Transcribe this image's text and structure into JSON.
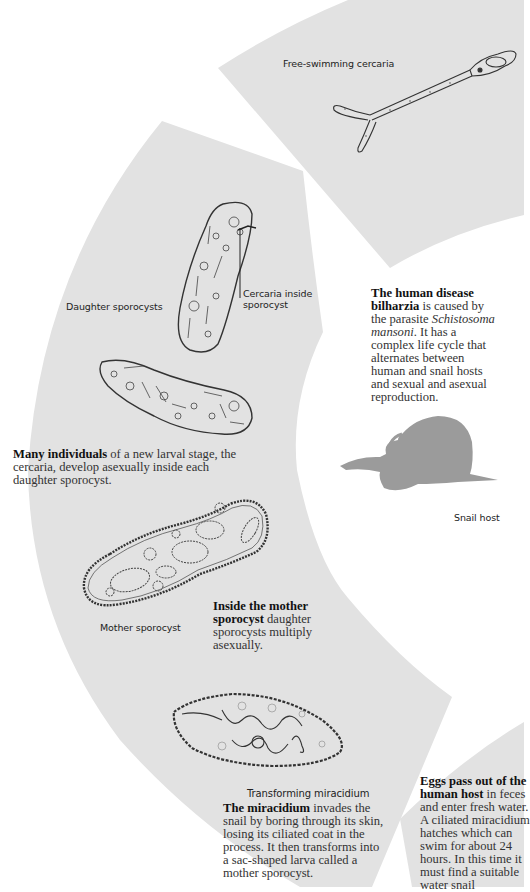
{
  "colors": {
    "sector_fill": "#e2e2e2",
    "page_bg": "#ffffff",
    "snail_fill": "#9b9b9b",
    "line": "#333333"
  },
  "labels": {
    "free_swimming_cercaria": "Free-swimming cercaria",
    "daughter_sporocysts": "Daughter sporocysts",
    "cercaria_inside_line1": "Cercaria inside",
    "cercaria_inside_line2": "sporocyst",
    "snail_host": "Snail host",
    "mother_sporocyst": "Mother sporocyst",
    "transforming_miracidium": "Transforming miracidium"
  },
  "paragraphs": {
    "intro": {
      "bold": "The human disease bilharzia",
      "text_before_italic": " is caused by the parasite ",
      "italic": "Schistosoma mansoni",
      "text_after_italic": ". It has a complex life cycle that alternates between human and snail hosts and sexual and asexual reproduction."
    },
    "many_individuals": {
      "bold": "Many individuals",
      "text": " of a new larval stage, the cercaria, develop asexually inside each daughter sporocyst."
    },
    "inside_mother": {
      "bold": "Inside the mother sporocyst",
      "text": " daughter sporocysts multiply asexually."
    },
    "miracidium": {
      "bold": "The miracidium",
      "text": " invades the snail by boring through its skin, losing its ciliated coat in the process. It then transforms into a sac-shaped larva called a mother sporocyst."
    },
    "eggs": {
      "bold": "Eggs pass out of the human host",
      "text": " in feces and enter fresh water. A ciliated miracidium hatches which can swim for about 24 hours. In this time it must find a suitable water snail"
    }
  },
  "icons": {
    "cercaria": "free-swimming-cercaria-illustration",
    "daughter_sporocyst_upright": "daughter-sporocyst-illustration",
    "daughter_sporocyst_horizontal": "daughter-sporocyst-illustration",
    "mother_sporocyst": "mother-sporocyst-illustration",
    "miracidium": "transforming-miracidium-illustration",
    "snail": "snail-silhouette"
  }
}
